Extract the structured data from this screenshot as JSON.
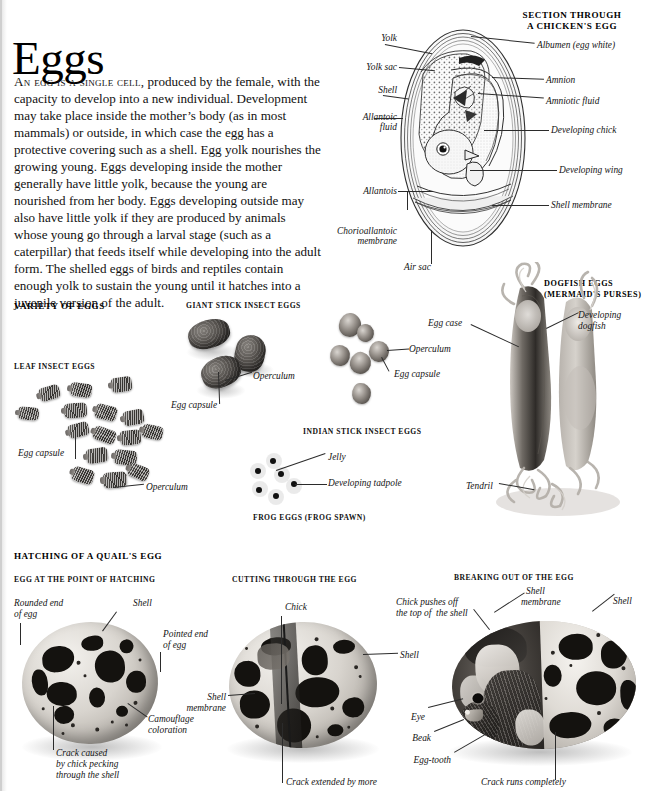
{
  "page": {
    "title": "Eggs",
    "intro_leadin": "An egg is a single cell,",
    "intro_body": " produced by the female, with the capacity to develop into a new individual. Development may take place inside the mother’s body (as in most mammals) or outside, in which case the egg has a protective covering such as a shell. Egg yolk nourishes the growing young. Eggs developing inside the mother generally have little yolk, because the young are nourished from her body. Eggs developing outside may also have little yolk if they are produced by animals whose young go through a larval stage (such as a caterpillar) that feeds itself while developing into the adult form. The shelled eggs of birds and reptiles contain enough yolk to sustain the young until it hatches into a juvenile version of the adult."
  },
  "chicken_section": {
    "heading_line1": "SECTION THROUGH",
    "heading_line2": "A CHICKEN'S EGG",
    "labels": {
      "yolk": "Yolk",
      "yolk_sac": "Yolk sac",
      "shell": "Shell",
      "allantoic_fluid_1": "Allantoic",
      "allantoic_fluid_2": "fluid",
      "allantois": "Allantois",
      "chorioallantoic_1": "Chorioallantoic",
      "chorioallantoic_2": "membrane",
      "air_sac": "Air sac",
      "albumen": "Albumen (egg white)",
      "amnion": "Amnion",
      "amniotic_fluid": "Amniotic fluid",
      "developing_chick": "Developing chick",
      "developing_wing": "Developing wing",
      "shell_membrane": "Shell membrane"
    }
  },
  "variety_section": {
    "heading": "VARIETY OF EGGS",
    "leaf_insect": {
      "heading": "LEAF INSECT EGGS",
      "label_capsule": "Egg capsule",
      "label_operculum": "Operculum"
    },
    "giant_stick_insect": {
      "heading": "GIANT STICK INSECT EGGS",
      "label_capsule": "Egg capsule",
      "label_operculum": "Operculum"
    },
    "indian_stick_insect": {
      "heading": "INDIAN STICK INSECT EGGS",
      "label_operculum": "Operculum",
      "label_capsule": "Egg capsule"
    },
    "frog": {
      "heading": "FROG EGGS (FROG SPAWN)",
      "label_jelly": "Jelly",
      "label_tadpole": "Developing tadpole"
    },
    "dogfish": {
      "heading_line1": "DOGFISH EGGS",
      "heading_line2": "(MERMAID'S PURSES)",
      "label_egg_case": "Egg case",
      "label_developing_1": "Developing",
      "label_developing_2": "dogfish",
      "label_tendril": "Tendril"
    }
  },
  "hatching_section": {
    "heading": "HATCHING OF A QUAIL'S EGG",
    "stage1": {
      "heading": "EGG AT THE POINT OF HATCHING",
      "label_rounded_1": "Rounded end",
      "label_rounded_2": "of egg",
      "label_shell": "Shell",
      "label_pointed_1": "Pointed end",
      "label_pointed_2": "of egg",
      "label_camouflage_1": "Camouflage",
      "label_camouflage_2": "coloration",
      "label_crack_1": "Crack caused",
      "label_crack_2": "by chick pecking",
      "label_crack_3": "through the shell"
    },
    "stage2": {
      "heading": "CUTTING THROUGH THE EGG",
      "label_chick": "Chick",
      "label_shell": "Shell",
      "label_shell_membrane_1": "Shell",
      "label_shell_membrane_2": "membrane",
      "label_crack": "Crack extended by more"
    },
    "stage3": {
      "heading": "BREAKING OUT OF THE EGG",
      "label_pushes_1": "Chick pushes off",
      "label_pushes_2": "the top of  the shell",
      "label_shell_membrane_1": "Shell",
      "label_shell_membrane_2": "membrane",
      "label_shell": "Shell",
      "label_eye": "Eye",
      "label_beak": "Beak",
      "label_egg_tooth": "Egg-tooth",
      "label_crack": "Crack runs completely"
    }
  }
}
